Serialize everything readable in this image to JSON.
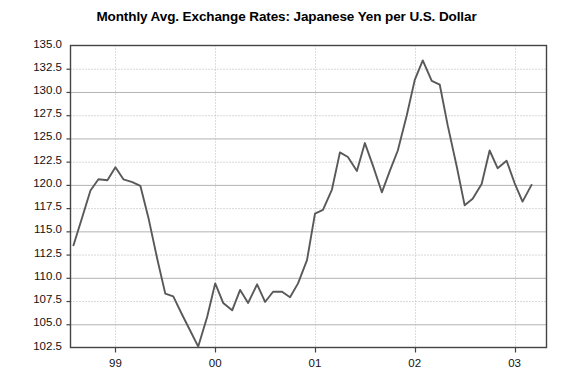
{
  "chart_data": {
    "type": "line",
    "title": "Monthly Avg. Exchange Rates: Japanese Yen per U.S. Dollar",
    "xlabel": "",
    "ylabel": "",
    "ylim": [
      102.5,
      135.0
    ],
    "ytick_labels": [
      "135.0",
      "132.5",
      "130.0",
      "127.5",
      "125.0",
      "122.5",
      "120.0",
      "117.5",
      "115.0",
      "112.5",
      "110.0",
      "107.5",
      "105.0",
      "102.5"
    ],
    "ytick_values": [
      135.0,
      132.5,
      130.0,
      127.5,
      125.0,
      122.5,
      120.0,
      117.5,
      115.0,
      112.5,
      110.0,
      107.5,
      105.0,
      102.5
    ],
    "xtick_labels": [
      "99",
      "00",
      "01",
      "02",
      "03"
    ],
    "xtick_values": [
      1999.0,
      2000.0,
      2001.0,
      2002.0,
      2003.0
    ],
    "xlim": [
      1998.55,
      2003.32
    ],
    "grid": true,
    "legend": "none",
    "line_color": "#595959",
    "series": [
      {
        "name": "JPY per USD",
        "x": [
          1998.58,
          1998.67,
          1998.75,
          1998.83,
          1998.92,
          1999.0,
          1999.08,
          1999.17,
          1999.25,
          1999.33,
          1999.42,
          1999.5,
          1999.58,
          1999.67,
          1999.75,
          1999.83,
          1999.92,
          2000.0,
          2000.08,
          2000.17,
          2000.25,
          2000.33,
          2000.42,
          2000.5,
          2000.58,
          2000.67,
          2000.75,
          2000.83,
          2000.92,
          2001.0,
          2001.08,
          2001.17,
          2001.25,
          2001.33,
          2001.42,
          2001.5,
          2001.58,
          2001.67,
          2001.75,
          2001.83,
          2001.92,
          2002.0,
          2002.08,
          2002.17,
          2002.25,
          2002.33,
          2002.42,
          2002.5,
          2002.58,
          2002.67,
          2002.75,
          2002.83,
          2002.92,
          2003.0,
          2003.08,
          2003.17
        ],
        "values": [
          113.5,
          116.6,
          119.4,
          120.6,
          120.5,
          121.9,
          120.6,
          120.3,
          119.9,
          116.5,
          112.0,
          108.3,
          108.0,
          106.0,
          104.3,
          102.6,
          105.8,
          109.4,
          107.3,
          106.5,
          108.7,
          107.3,
          109.3,
          107.4,
          108.5,
          108.5,
          107.9,
          109.4,
          111.9,
          116.9,
          117.3,
          119.5,
          123.5,
          123.0,
          121.5,
          124.5,
          122.1,
          119.2,
          121.5,
          123.7,
          127.5,
          131.3,
          133.4,
          131.2,
          130.8,
          126.4,
          122.0,
          117.8,
          118.5,
          120.1,
          123.7,
          121.8,
          122.6,
          120.2,
          118.2,
          120.0
        ]
      }
    ]
  }
}
